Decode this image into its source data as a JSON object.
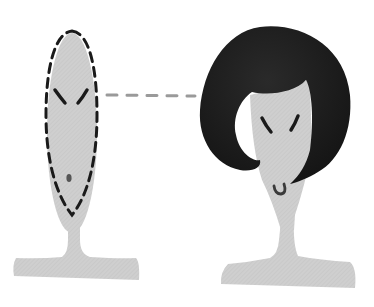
{
  "illustration": {
    "description": "Two mannequin-head stands: left with dashed oval face outline, right wearing a black bob wig",
    "colors": {
      "background": "#ffffff",
      "stand_fill": "#cfcfcf",
      "outline": "#1a1a1a",
      "hair": "#1c1c1c",
      "connector": "#9a9a9a"
    },
    "left_figure": {
      "label": "oval-face-outline",
      "features": [
        "eyebrows",
        "mouth-dot"
      ]
    },
    "right_figure": {
      "label": "face-with-bob-hairstyle",
      "features": [
        "eyebrows",
        "hooked-mouth",
        "bob-hair"
      ]
    },
    "connector": {
      "style": "dashed",
      "from": "left-face",
      "to": "right-hair"
    }
  }
}
